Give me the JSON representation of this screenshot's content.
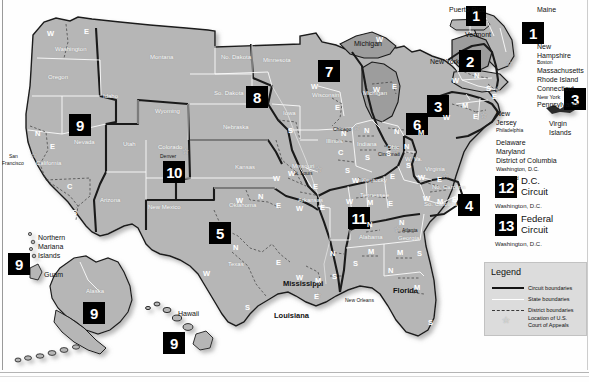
{
  "document": {
    "title": "Geographic Boundaries of United States Courts of Appeals and United States District Courts"
  },
  "legend": {
    "title": "Legend",
    "items": [
      {
        "key": "circuit-boundary-key",
        "label": "Circuit boundaries"
      },
      {
        "key": "state-boundary-key",
        "label": "State boundaries"
      },
      {
        "key": "district-boundary-key",
        "label": "District boundaries"
      },
      {
        "key": "court-location-key",
        "label": "Location of U.S.\nCourt of Appeals"
      }
    ],
    "item_labels": {
      "circuit": "Circuit boundaries",
      "state": "State boundaries",
      "district": "District boundaries",
      "court_line1": "Location of U.S.",
      "court_line2": "Court of Appeals"
    }
  },
  "circuit_cards": [
    {
      "number": "12",
      "name_line1": "D.C.",
      "name_line2": "Circuit",
      "city": "Washington, D.C."
    },
    {
      "number": "13",
      "name_line1": "Federal",
      "name_line2": "Circuit",
      "city": "Washington, D.C."
    }
  ],
  "circuit_badges": [
    {
      "number": "1",
      "region": "puerto-rico"
    },
    {
      "number": "1",
      "region": "maine-new-england"
    },
    {
      "number": "2",
      "region": "new-york-vermont"
    },
    {
      "number": "3",
      "region": "pennsylvania-new-jersey"
    },
    {
      "number": "3",
      "region": "virgin-islands"
    },
    {
      "number": "4",
      "region": "virginia-carolinas"
    },
    {
      "number": "5",
      "region": "texas-louisiana-mississippi"
    },
    {
      "number": "6",
      "region": "ohio-michigan-kentucky-tennessee"
    },
    {
      "number": "7",
      "region": "wisconsin-illinois-indiana"
    },
    {
      "number": "8",
      "region": "dakotas-nebraska-missouri"
    },
    {
      "number": "9",
      "region": "nevada-west"
    },
    {
      "number": "9",
      "region": "northern-mariana-islands-guam"
    },
    {
      "number": "9",
      "region": "alaska"
    },
    {
      "number": "9",
      "region": "hawaii"
    },
    {
      "number": "10",
      "region": "colorado-mountain"
    },
    {
      "number": "11",
      "region": "alabama-georgia-florida"
    }
  ],
  "states": [
    {
      "name": "Washington",
      "x": 61,
      "y": 49
    },
    {
      "name": "Oregon",
      "x": 53,
      "y": 77
    },
    {
      "name": "Idaho",
      "x": 106,
      "y": 96
    },
    {
      "name": "Montana",
      "x": 155,
      "y": 57
    },
    {
      "name": "Nevada",
      "x": 79,
      "y": 141
    },
    {
      "name": "California",
      "x": 42,
      "y": 163
    },
    {
      "name": "Utah",
      "x": 127,
      "y": 143
    },
    {
      "name": "Wyoming",
      "x": 161,
      "y": 111
    },
    {
      "name": "Colorado",
      "x": 163,
      "y": 147
    },
    {
      "name": "Arizona",
      "x": 106,
      "y": 199
    },
    {
      "name": "New Mexico",
      "x": 155,
      "y": 206
    },
    {
      "name": "No. Dakota",
      "x": 228,
      "y": 57
    },
    {
      "name": "So. Dakota",
      "x": 221,
      "y": 93
    },
    {
      "name": "Nebraska",
      "x": 230,
      "y": 126
    },
    {
      "name": "Kansas",
      "x": 240,
      "y": 166
    },
    {
      "name": "Oklahoma",
      "x": 237,
      "y": 204
    },
    {
      "name": "Texas",
      "x": 232,
      "y": 263
    },
    {
      "name": "Minnesota",
      "x": 271,
      "y": 60
    },
    {
      "name": "Iowa",
      "x": 287,
      "y": 112
    },
    {
      "name": "Missouri",
      "x": 299,
      "y": 165
    },
    {
      "name": "Arkansas",
      "x": 304,
      "y": 199
    },
    {
      "name": "Louisiana",
      "x": 298,
      "y": 312
    },
    {
      "name": "Wisconsin",
      "x": 318,
      "y": 95
    },
    {
      "name": "Illinois",
      "x": 330,
      "y": 140
    },
    {
      "name": "Indiana",
      "x": 362,
      "y": 143
    },
    {
      "name": "Michigan",
      "x": 370,
      "y": 103
    },
    {
      "name": "Ohio",
      "x": 392,
      "y": 146
    },
    {
      "name": "Kentucky",
      "x": 371,
      "y": 179
    },
    {
      "name": "Tennessee",
      "x": 370,
      "y": 194
    },
    {
      "name": "Mississippi",
      "x": 343,
      "y": 286
    },
    {
      "name": "Alabama",
      "x": 365,
      "y": 236
    },
    {
      "name": "Georgia",
      "x": 404,
      "y": 237
    },
    {
      "name": "Florida",
      "x": 398,
      "y": 288
    },
    {
      "name": "W. Va.",
      "x": 411,
      "y": 158
    },
    {
      "name": "Virginia",
      "x": 432,
      "y": 168
    },
    {
      "name": "No. Carolina",
      "x": 443,
      "y": 186
    },
    {
      "name": "So. Carolina",
      "x": 435,
      "y": 203
    },
    {
      "name": "Alaska",
      "x": 92,
      "y": 290
    },
    {
      "name": "Hawaii",
      "x": 182,
      "y": 313
    }
  ],
  "outside_labels": [
    {
      "name": "Michigan",
      "x": 358,
      "y": 44
    },
    {
      "name": "Puerto Rico",
      "x": 452,
      "y": 9
    },
    {
      "name": "Vermont",
      "x": 470,
      "y": 34
    },
    {
      "name": "New York",
      "x": 435,
      "y": 61
    },
    {
      "name": "Maine",
      "x": 540,
      "y": 9
    },
    {
      "name": "New Hampshire",
      "x": 538,
      "y": 46
    },
    {
      "name": "Massachusetts",
      "x": 538,
      "y": 70
    },
    {
      "name": "Rhode Island",
      "x": 538,
      "y": 78
    },
    {
      "name": "Connecticut",
      "x": 538,
      "y": 86
    },
    {
      "name": "New York",
      "x": 538,
      "y": 94
    },
    {
      "name": "Pennsylvania",
      "x": 538,
      "y": 102
    },
    {
      "name": "New Jersey",
      "x": 497,
      "y": 112
    },
    {
      "name": "Delaware",
      "x": 497,
      "y": 141
    },
    {
      "name": "Maryland",
      "x": 497,
      "y": 149
    },
    {
      "name": "District of Columbia",
      "x": 497,
      "y": 157
    },
    {
      "name": "Virgin Islands",
      "x": 550,
      "y": 125
    },
    {
      "name": "Northern Mariana Islands",
      "x": 40,
      "y": 238
    },
    {
      "name": "Guam",
      "x": 46,
      "y": 275
    },
    {
      "name": "Mississippi",
      "x": 285,
      "y": 281
    },
    {
      "name": "Florida",
      "x": 396,
      "y": 288
    },
    {
      "name": "Louisiana",
      "x": 278,
      "y": 314
    }
  ],
  "new_england_labels": {
    "new_hampshire_l1": "New",
    "new_hampshire_l2": "Hampshire",
    "massachusetts": "Massachusetts",
    "rhode_island": "Rhode Island",
    "connecticut": "Connecticut",
    "new_york": "New York",
    "pennsylvania": "Pennsylvania",
    "new_jersey_l1": "New",
    "new_jersey_l2": "Jersey",
    "delaware": "Delaware",
    "maryland": "Maryland",
    "dc": "District of Columbia",
    "washington_dc": "Washington, D.C.",
    "maine": "Maine",
    "vermont": "Vermont",
    "ny_west": "New York",
    "puerto_rico": "Puerto Rico",
    "virgin_islands_l1": "Virgin",
    "virgin_islands_l2": "Islands"
  },
  "cities": [
    {
      "name": "San Francisco",
      "line1": "San",
      "line2": "Francisco",
      "x": 12,
      "y": 157
    },
    {
      "name": "Denver",
      "x": 163,
      "y": 155
    },
    {
      "name": "Chicago",
      "x": 339,
      "y": 128
    },
    {
      "name": "St. Louis",
      "x": 300,
      "y": 172
    },
    {
      "name": "Cincinnati",
      "x": 388,
      "y": 153
    },
    {
      "name": "Atlanta",
      "x": 404,
      "y": 229
    },
    {
      "name": "New Orleans",
      "x": 340,
      "y": 298
    },
    {
      "name": "Boston",
      "x": 538,
      "y": 62
    },
    {
      "name": "Philadelphia",
      "x": 497,
      "y": 128
    },
    {
      "name": "Richmond",
      "x": 497,
      "y": 165
    },
    {
      "name": "New York",
      "x": 538,
      "y": 94
    }
  ],
  "territory_labels": {
    "northern_mariana_l1": "Northern",
    "northern_mariana_l2": "Mariana",
    "northern_mariana_l3": "Islands",
    "guam": "Guam",
    "alaska": "Alaska",
    "hawaii": "Hawaii"
  },
  "district_letters": [
    {
      "letter": "W",
      "state": "washington",
      "x": 47,
      "y": 33
    },
    {
      "letter": "E",
      "state": "washington",
      "x": 84,
      "y": 31
    },
    {
      "letter": "N",
      "state": "california",
      "x": 35,
      "y": 133
    },
    {
      "letter": "E",
      "state": "california",
      "x": 50,
      "y": 146
    },
    {
      "letter": "C",
      "state": "california",
      "x": 67,
      "y": 186
    },
    {
      "letter": "S",
      "state": "california",
      "x": 72,
      "y": 212
    },
    {
      "letter": "S",
      "state": "iowa",
      "x": 288,
      "y": 130
    },
    {
      "letter": "W",
      "state": "missouri",
      "x": 288,
      "y": 173
    },
    {
      "letter": "E",
      "state": "missouri",
      "x": 313,
      "y": 186
    },
    {
      "letter": "W",
      "state": "arkansas",
      "x": 296,
      "y": 208
    },
    {
      "letter": "E",
      "state": "arkansas",
      "x": 320,
      "y": 207
    },
    {
      "letter": "N",
      "state": "oklahoma",
      "x": 258,
      "y": 196
    },
    {
      "letter": "W",
      "state": "oklahoma",
      "x": 236,
      "y": 200
    },
    {
      "letter": "E",
      "state": "oklahoma",
      "x": 276,
      "y": 205
    },
    {
      "letter": "N",
      "state": "texas",
      "x": 233,
      "y": 247
    },
    {
      "letter": "W",
      "state": "texas",
      "x": 203,
      "y": 273
    },
    {
      "letter": "E",
      "state": "texas",
      "x": 276,
      "y": 262
    },
    {
      "letter": "S",
      "state": "texas",
      "x": 245,
      "y": 307
    },
    {
      "letter": "W",
      "state": "louisiana",
      "x": 296,
      "y": 277
    },
    {
      "letter": "M",
      "state": "louisiana",
      "x": 315,
      "y": 280
    },
    {
      "letter": "E",
      "state": "louisiana",
      "x": 314,
      "y": 296
    },
    {
      "letter": "N",
      "state": "mississippi",
      "x": 330,
      "y": 253
    },
    {
      "letter": "S",
      "state": "mississippi",
      "x": 332,
      "y": 276
    },
    {
      "letter": "W",
      "state": "wisconsin",
      "x": 311,
      "y": 86
    },
    {
      "letter": "E",
      "state": "wisconsin",
      "x": 335,
      "y": 107
    },
    {
      "letter": "N",
      "state": "illinois",
      "x": 341,
      "y": 133
    },
    {
      "letter": "C",
      "state": "illinois",
      "x": 338,
      "y": 152
    },
    {
      "letter": "S",
      "state": "illinois",
      "x": 345,
      "y": 170
    },
    {
      "letter": "N",
      "state": "indiana",
      "x": 364,
      "y": 130
    },
    {
      "letter": "S",
      "state": "indiana",
      "x": 365,
      "y": 157
    },
    {
      "letter": "W",
      "state": "michigan",
      "x": 376,
      "y": 39
    },
    {
      "letter": "W",
      "state": "michigan2",
      "x": 373,
      "y": 89
    },
    {
      "letter": "E",
      "state": "michigan2",
      "x": 392,
      "y": 86
    },
    {
      "letter": "N",
      "state": "ohio",
      "x": 394,
      "y": 131
    },
    {
      "letter": "S",
      "state": "ohio",
      "x": 386,
      "y": 153
    },
    {
      "letter": "W",
      "state": "kentucky",
      "x": 352,
      "y": 180
    },
    {
      "letter": "E",
      "state": "kentucky",
      "x": 390,
      "y": 176
    },
    {
      "letter": "W",
      "state": "tennessee",
      "x": 346,
      "y": 201
    },
    {
      "letter": "M",
      "state": "tennessee",
      "x": 367,
      "y": 202
    },
    {
      "letter": "E",
      "state": "tennessee",
      "x": 388,
      "y": 203
    },
    {
      "letter": "N",
      "state": "alabama",
      "x": 367,
      "y": 224
    },
    {
      "letter": "M",
      "state": "alabama",
      "x": 368,
      "y": 251
    },
    {
      "letter": "S",
      "state": "alabama",
      "x": 363,
      "y": 263
    },
    {
      "letter": "N",
      "state": "georgia",
      "x": 399,
      "y": 222
    },
    {
      "letter": "M",
      "state": "georgia",
      "x": 397,
      "y": 252
    },
    {
      "letter": "S",
      "state": "georgia",
      "x": 417,
      "y": 253
    },
    {
      "letter": "N",
      "state": "florida",
      "x": 388,
      "y": 270
    },
    {
      "letter": "M",
      "state": "florida",
      "x": 414,
      "y": 287
    },
    {
      "letter": "S",
      "state": "florida",
      "x": 428,
      "y": 322
    },
    {
      "letter": "N",
      "state": "westvirginia",
      "x": 404,
      "y": 146
    },
    {
      "letter": "S",
      "state": "westvirginia",
      "x": 406,
      "y": 165
    },
    {
      "letter": "W",
      "state": "virginia",
      "x": 418,
      "y": 177
    },
    {
      "letter": "E",
      "state": "virginia",
      "x": 437,
      "y": 179
    },
    {
      "letter": "W",
      "state": "nocarolina",
      "x": 423,
      "y": 190
    },
    {
      "letter": "M",
      "state": "nocarolina",
      "x": 437,
      "y": 193
    },
    {
      "letter": "E",
      "state": "nocarolina",
      "x": 452,
      "y": 191
    },
    {
      "letter": "W",
      "state": "newyork",
      "x": 465,
      "y": 80
    },
    {
      "letter": "N",
      "state": "newyork",
      "x": 483,
      "y": 75
    },
    {
      "letter": "S",
      "state": "newyork",
      "x": 494,
      "y": 90
    },
    {
      "letter": "E",
      "state": "newyork",
      "x": 497,
      "y": 97
    },
    {
      "letter": "M",
      "state": "pennsylvania",
      "x": 470,
      "y": 105
    },
    {
      "letter": "W",
      "state": "pennsylvania",
      "x": 449,
      "y": 117
    },
    {
      "letter": "E",
      "state": "pennsylvania",
      "x": 479,
      "y": 116
    },
    {
      "letter": "M",
      "state": "tennessee2",
      "x": 418,
      "y": 132
    },
    {
      "letter": "W",
      "state": "kansas",
      "x": 273,
      "y": 178
    }
  ]
}
